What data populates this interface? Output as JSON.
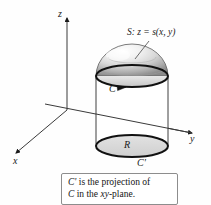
{
  "figure": {
    "background_color": "#fefefe",
    "ink_color": "#1a1a1a",
    "axes": {
      "z_label": "z",
      "x_label": "x",
      "y_label": "y",
      "origin_px": [
        67,
        110
      ]
    },
    "labels": {
      "surface": "S: z = s(x, y)",
      "curve_top": "C",
      "region": "R",
      "curve_projection": "C'"
    },
    "caption": {
      "line1_curve": "C'",
      "line1_rest": " is the projection of",
      "line2_curve": "C",
      "line2_mid": " in the ",
      "line2_plane": "xy",
      "line2_end": "-plane."
    },
    "geometry": {
      "cylinder_center_x": 132,
      "cylinder_radius_x": 36,
      "ellipse_radius_y": 11,
      "top_ellipse_cy": 76,
      "bottom_ellipse_cy": 146,
      "dome_apex_y": 44,
      "dome_fill_light": "#ffffff",
      "dome_fill_mid": "#d2d2d2",
      "dome_fill_dark": "#8c8c8c",
      "region_fill": "#d9d9d9"
    }
  }
}
